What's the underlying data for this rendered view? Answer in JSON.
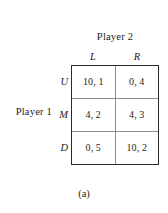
{
  "figure": {
    "caption": "(a)",
    "column_player_label": "Player 2",
    "row_player_label": "Player 1"
  },
  "chart_data": {
    "type": "table",
    "title": "",
    "subtitle": "",
    "xlabel": "Player 2",
    "ylabel": "Player 1",
    "annotations": [
      "(a)"
    ],
    "grid": true,
    "legend_position": "none",
    "row_player": "Player 1",
    "column_player": "Player 2",
    "row_labels": [
      "U",
      "M",
      "D"
    ],
    "column_labels": [
      "L",
      "R"
    ],
    "cells": [
      [
        {
          "row": "U",
          "col": "L",
          "text": "10, 1",
          "row_payoff": 10,
          "col_payoff": 1
        },
        {
          "row": "U",
          "col": "R",
          "text": "0, 4",
          "row_payoff": 0,
          "col_payoff": 4
        }
      ],
      [
        {
          "row": "M",
          "col": "L",
          "text": "4, 2",
          "row_payoff": 4,
          "col_payoff": 2
        },
        {
          "row": "M",
          "col": "R",
          "text": "4, 3",
          "row_payoff": 4,
          "col_payoff": 3
        }
      ],
      [
        {
          "row": "D",
          "col": "L",
          "text": "0, 5",
          "row_payoff": 0,
          "col_payoff": 5
        },
        {
          "row": "D",
          "col": "R",
          "text": "10, 2",
          "row_payoff": 10,
          "col_payoff": 2
        }
      ]
    ],
    "colors": {
      "outer_border": "#2b2b2b",
      "inner_border": "#8d8d8d",
      "text": "#1c1c1c",
      "background": "#ffffff"
    }
  }
}
